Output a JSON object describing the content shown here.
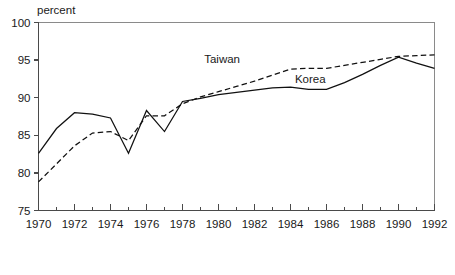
{
  "chart_data": {
    "type": "line",
    "title": "",
    "xlabel": "",
    "ylabel": "percent",
    "xlim": [
      1970,
      1992
    ],
    "ylim": [
      75,
      100
    ],
    "grid": false,
    "legend_position": "inline-annotation",
    "y_ticks": [
      75,
      80,
      85,
      90,
      95,
      100
    ],
    "y_tick_labels": [
      "75",
      "80",
      "85",
      "90",
      "95",
      "100"
    ],
    "x_ticks_major": [
      1970,
      1972,
      1974,
      1976,
      1978,
      1980,
      1982,
      1984,
      1986,
      1988,
      1990,
      1992
    ],
    "x_tick_labels": [
      "1970",
      "1972",
      "1974",
      "1976",
      "1978",
      "1980",
      "1982",
      "1984",
      "1986",
      "1988",
      "1990",
      "1992"
    ],
    "x_ticks_minor": [
      1971,
      1973,
      1975,
      1977,
      1979,
      1981,
      1983,
      1985,
      1987,
      1989,
      1991
    ],
    "x": [
      1970,
      1971,
      1972,
      1973,
      1974,
      1975,
      1976,
      1977,
      1978,
      1979,
      1980,
      1981,
      1982,
      1983,
      1984,
      1985,
      1986,
      1987,
      1988,
      1989,
      1990,
      1991,
      1992
    ],
    "series": [
      {
        "name": "Korea",
        "style": "solid",
        "color": "#111111",
        "label_x": 1985.1,
        "label_y": 91.9,
        "values": [
          82.6,
          85.9,
          88.0,
          87.8,
          87.3,
          82.6,
          88.3,
          85.5,
          89.5,
          89.9,
          90.4,
          90.7,
          91.0,
          91.3,
          91.4,
          91.1,
          91.1,
          92.0,
          93.1,
          94.3,
          95.4,
          94.6,
          93.9
        ]
      },
      {
        "name": "Taiwan",
        "style": "dashed",
        "color": "#111111",
        "label_x": 1980.2,
        "label_y": 94.6,
        "values": [
          78.8,
          81.2,
          83.6,
          85.3,
          85.5,
          84.3,
          87.6,
          87.6,
          89.2,
          90.1,
          90.8,
          91.5,
          92.2,
          93.0,
          93.8,
          93.9,
          93.9,
          94.3,
          94.7,
          95.1,
          95.5,
          95.6,
          95.7
        ]
      }
    ]
  },
  "axis": {
    "unit_label": "percent"
  }
}
